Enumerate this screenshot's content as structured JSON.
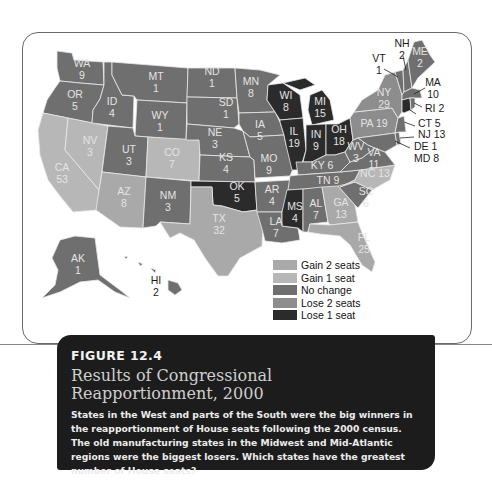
{
  "chart_data": {
    "type": "choropleth-map",
    "title": "Results of Congressional Reapportionment, 2000",
    "figure_number": "FIGURE 12.4",
    "legend": [
      {
        "category": "gain2",
        "label": "Gain 2 seats",
        "color": "#a9a9a9"
      },
      {
        "category": "gain1",
        "label": "Gain 1 seat",
        "color": "#b7b7b7"
      },
      {
        "category": "none",
        "label": "No change",
        "color": "#6f6f6f"
      },
      {
        "category": "lose2",
        "label": "Lose 2 seats",
        "color": "#8d8d8d"
      },
      {
        "category": "lose1",
        "label": "Lose 1 seat",
        "color": "#2b2b2b"
      }
    ],
    "states": [
      {
        "state": "WA",
        "seats": 9,
        "change": "none"
      },
      {
        "state": "OR",
        "seats": 5,
        "change": "none"
      },
      {
        "state": "CA",
        "seats": 53,
        "change": "gain1"
      },
      {
        "state": "NV",
        "seats": 3,
        "change": "gain1"
      },
      {
        "state": "ID",
        "seats": 4,
        "change": "none"
      },
      {
        "state": "MT",
        "seats": 1,
        "change": "none"
      },
      {
        "state": "WY",
        "seats": 1,
        "change": "none"
      },
      {
        "state": "UT",
        "seats": 3,
        "change": "none"
      },
      {
        "state": "AZ",
        "seats": 8,
        "change": "gain2"
      },
      {
        "state": "CO",
        "seats": 7,
        "change": "gain1"
      },
      {
        "state": "NM",
        "seats": 3,
        "change": "none"
      },
      {
        "state": "ND",
        "seats": 1,
        "change": "none"
      },
      {
        "state": "SD",
        "seats": 1,
        "change": "none"
      },
      {
        "state": "NE",
        "seats": 3,
        "change": "none"
      },
      {
        "state": "KS",
        "seats": 4,
        "change": "none"
      },
      {
        "state": "OK",
        "seats": 5,
        "change": "lose1"
      },
      {
        "state": "TX",
        "seats": 32,
        "change": "gain2"
      },
      {
        "state": "MN",
        "seats": 8,
        "change": "none"
      },
      {
        "state": "IA",
        "seats": 5,
        "change": "none"
      },
      {
        "state": "MO",
        "seats": 9,
        "change": "none"
      },
      {
        "state": "AR",
        "seats": 4,
        "change": "none"
      },
      {
        "state": "LA",
        "seats": 7,
        "change": "none"
      },
      {
        "state": "WI",
        "seats": 8,
        "change": "lose1"
      },
      {
        "state": "IL",
        "seats": 19,
        "change": "lose1"
      },
      {
        "state": "MI",
        "seats": 15,
        "change": "lose1"
      },
      {
        "state": "IN",
        "seats": 9,
        "change": "lose1"
      },
      {
        "state": "OH",
        "seats": 18,
        "change": "lose1"
      },
      {
        "state": "KY",
        "seats": 6,
        "change": "none"
      },
      {
        "state": "TN",
        "seats": 9,
        "change": "none"
      },
      {
        "state": "MS",
        "seats": 4,
        "change": "lose1"
      },
      {
        "state": "AL",
        "seats": 7,
        "change": "none"
      },
      {
        "state": "GA",
        "seats": 13,
        "change": "gain2"
      },
      {
        "state": "FL",
        "seats": 25,
        "change": "gain2"
      },
      {
        "state": "SC",
        "seats": 6,
        "change": "none"
      },
      {
        "state": "NC",
        "seats": 13,
        "change": "gain1"
      },
      {
        "state": "VA",
        "seats": 11,
        "change": "none"
      },
      {
        "state": "WV",
        "seats": 3,
        "change": "none"
      },
      {
        "state": "PA",
        "seats": 19,
        "change": "lose2"
      },
      {
        "state": "NY",
        "seats": 29,
        "change": "lose2"
      },
      {
        "state": "VT",
        "seats": 1,
        "change": "none"
      },
      {
        "state": "NH",
        "seats": 2,
        "change": "none"
      },
      {
        "state": "ME",
        "seats": 2,
        "change": "none"
      },
      {
        "state": "MA",
        "seats": 10,
        "change": "none"
      },
      {
        "state": "RI",
        "seats": 2,
        "change": "none"
      },
      {
        "state": "CT",
        "seats": 5,
        "change": "lose1"
      },
      {
        "state": "NJ",
        "seats": 13,
        "change": "none"
      },
      {
        "state": "DE",
        "seats": 1,
        "change": "none"
      },
      {
        "state": "MD",
        "seats": 8,
        "change": "none"
      },
      {
        "state": "AK",
        "seats": 1,
        "change": "none"
      },
      {
        "state": "HI",
        "seats": 2,
        "change": "none"
      }
    ]
  },
  "labels": {
    "WA": [
      "WA",
      "9"
    ],
    "OR": [
      "OR",
      "5"
    ],
    "CA": [
      "CA",
      "53"
    ],
    "NV": [
      "NV",
      "3"
    ],
    "ID": [
      "ID",
      "4"
    ],
    "MT": [
      "MT",
      "1"
    ],
    "WY": [
      "WY",
      "1"
    ],
    "UT": [
      "UT",
      "3"
    ],
    "AZ": [
      "AZ",
      "8"
    ],
    "CO": [
      "CO",
      "7"
    ],
    "NM": [
      "NM",
      "3"
    ],
    "ND": [
      "ND",
      "1"
    ],
    "SD": [
      "SD",
      "1"
    ],
    "NE": [
      "NE",
      "3"
    ],
    "KS": [
      "KS",
      "4"
    ],
    "OK": [
      "OK",
      "5"
    ],
    "TX": [
      "TX",
      "32"
    ],
    "MN": [
      "MN",
      "8"
    ],
    "IA": [
      "IA",
      "5"
    ],
    "MO": [
      "MO",
      "9"
    ],
    "AR": [
      "AR",
      "4"
    ],
    "LA": [
      "LA",
      "7"
    ],
    "WI": [
      "WI",
      "8"
    ],
    "IL": [
      "IL",
      "19"
    ],
    "MI": [
      "MI",
      "15"
    ],
    "IN": [
      "IN",
      "9"
    ],
    "OH": [
      "OH",
      "18"
    ],
    "KY": "KY 6",
    "TN": "TN 9",
    "MS": [
      "MS",
      "4"
    ],
    "AL": [
      "AL",
      "7"
    ],
    "GA": [
      "GA",
      "13"
    ],
    "FL": [
      "FL",
      "25"
    ],
    "SC": [
      "SC",
      "6"
    ],
    "NC": "NC 13",
    "VA": [
      "VA",
      "11"
    ],
    "WV": [
      "WV",
      "3"
    ],
    "PA": "PA 19",
    "NY": [
      "NY",
      "29"
    ],
    "VT": [
      "VT",
      "1"
    ],
    "NH": [
      "NH",
      "2"
    ],
    "ME": [
      "ME",
      "2"
    ],
    "MA": [
      "MA",
      "10"
    ],
    "RI": "RI 2",
    "CT": "CT 5",
    "NJ": "NJ 13",
    "DE": "DE 1",
    "MD": "MD 8",
    "AK": [
      "AK",
      "1"
    ],
    "HI": [
      "HI",
      "2"
    ]
  },
  "legend_labels": [
    "Gain 2 seats",
    "Gain 1 seat",
    "No change",
    "Lose 2 seats",
    "Lose 1 seat"
  ],
  "caption": {
    "figure_number": "FIGURE 12.4",
    "title_line1": "Results of Congressional",
    "title_line2": "Reapportionment, 2000",
    "body": "States in the West and parts of the South were the big winners in the reapportionment of House seats following the 2000 census. The old manufacturing states in the Midwest and Mid-Atlantic regions were the biggest losers. Which states have the greatest number of House seats?"
  }
}
